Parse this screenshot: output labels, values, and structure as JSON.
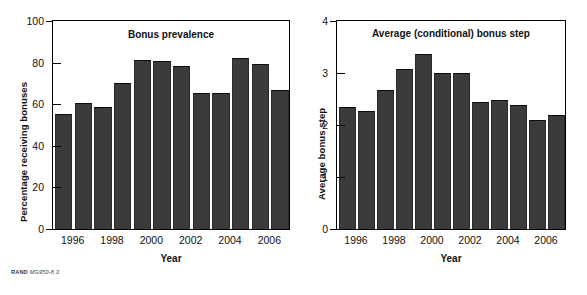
{
  "source_note": {
    "org": "RAND",
    "code": "MG950-8.3"
  },
  "colors": {
    "bar": "#3b3b3b",
    "axis": "#000000",
    "background": "#ffffff"
  },
  "panels": [
    {
      "key": "bonus_prevalence",
      "title": "Bonus prevalence",
      "ylabel": "Percentage receiving bonuses",
      "xlabel": "Year"
    },
    {
      "key": "average_bonus_step",
      "title": "Average (conditional) bonus step",
      "ylabel": "Average bonus step",
      "xlabel": "Year"
    }
  ],
  "chart_data": [
    {
      "type": "bar",
      "title": "Bonus prevalence",
      "xlabel": "Year",
      "ylabel": "Percentage receiving bonuses",
      "categories": [
        "1996",
        "1997",
        "1998",
        "1999",
        "2000",
        "2001",
        "2002",
        "2003",
        "2004",
        "2005",
        "2006",
        "2007"
      ],
      "values": [
        55,
        60,
        58,
        69.5,
        81,
        80.5,
        78,
        65,
        65,
        81.5,
        79,
        66.5
      ],
      "ylim": [
        0,
        100
      ],
      "yticks": [
        0,
        20,
        40,
        60,
        80,
        100
      ],
      "xticklabels": [
        "1996",
        "1998",
        "2000",
        "2002",
        "2004",
        "2006"
      ],
      "xtick_categories": [
        "1996",
        "1998",
        "2000",
        "2002",
        "2004",
        "2006"
      ],
      "grid": false,
      "legend": "none"
    },
    {
      "type": "bar",
      "title": "Average (conditional) bonus step",
      "xlabel": "Year",
      "ylabel": "Average bonus step",
      "categories": [
        "1996",
        "1997",
        "1998",
        "1999",
        "2000",
        "2001",
        "2002",
        "2003",
        "2004",
        "2005",
        "2006",
        "2007"
      ],
      "values": [
        2.33,
        2.25,
        2.65,
        3.06,
        3.35,
        2.98,
        2.98,
        2.43,
        2.46,
        2.37,
        2.08,
        2.18
      ],
      "ylim": [
        0,
        4
      ],
      "yticks": [
        0,
        1,
        2,
        3,
        4
      ],
      "xticklabels": [
        "1996",
        "1998",
        "2000",
        "2002",
        "2004",
        "2006"
      ],
      "xtick_categories": [
        "1996",
        "1998",
        "2000",
        "2002",
        "2004",
        "2006"
      ],
      "grid": false,
      "legend": "none"
    }
  ]
}
